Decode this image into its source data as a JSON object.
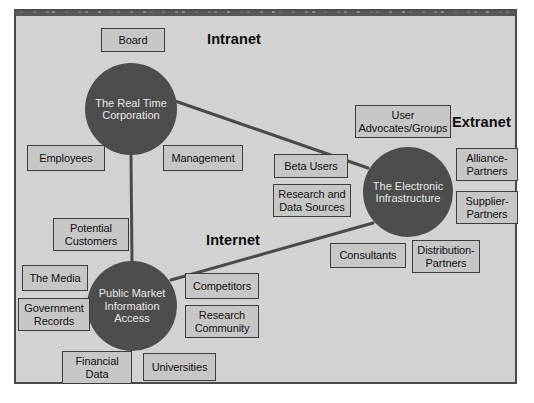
{
  "diagram": {
    "colors": {
      "page_background": "#ffffff",
      "frame_background": "#d2d2d2",
      "frame_border": "#4a4a4a",
      "box_fill": "#c6c6c6",
      "box_border": "#3d3d3d",
      "hub_fill": "#4d4d4d",
      "hub_text": "#e8e8e8",
      "edge_color": "#4a4a4a",
      "label_text": "#0d0d0d"
    },
    "zone_labels": [
      {
        "id": "intranet",
        "text": "Intranet",
        "x": 207,
        "y": 31
      },
      {
        "id": "extranet",
        "text": "Extranet",
        "x": 452,
        "y": 114
      },
      {
        "id": "internet",
        "text": "Internet",
        "x": 206,
        "y": 232
      }
    ],
    "hubs": [
      {
        "id": "real-time-corporation",
        "text": "The Real Time Corporation",
        "cx": 131,
        "cy": 109,
        "r": 46
      },
      {
        "id": "electronic-infrastructure",
        "text": "The Electronic Infrastructure",
        "cx": 408,
        "cy": 192,
        "r": 45
      },
      {
        "id": "public-market-information-access",
        "text": "Public Market Information Access",
        "cx": 132,
        "cy": 306,
        "r": 45
      }
    ],
    "boxes": [
      {
        "id": "board",
        "text": "Board",
        "x": 101,
        "y": 28,
        "w": 64,
        "h": 24
      },
      {
        "id": "employees",
        "text": "Employees",
        "x": 27,
        "y": 145,
        "w": 78,
        "h": 26
      },
      {
        "id": "management",
        "text": "Management",
        "x": 163,
        "y": 145,
        "w": 80,
        "h": 26
      },
      {
        "id": "user-advocates-groups",
        "text": "User Advocates/Groups",
        "x": 355,
        "y": 105,
        "w": 96,
        "h": 33
      },
      {
        "id": "beta-users",
        "text": "Beta Users",
        "x": 274,
        "y": 154,
        "w": 74,
        "h": 24
      },
      {
        "id": "research-and-data-sources",
        "text": "Research and Data Sources",
        "x": 273,
        "y": 184,
        "w": 78,
        "h": 33
      },
      {
        "id": "alliance-partners",
        "text": "Alliance- Partners",
        "x": 456,
        "y": 148,
        "w": 62,
        "h": 33
      },
      {
        "id": "supplier-partners",
        "text": "Supplier- Partners",
        "x": 456,
        "y": 191,
        "w": 62,
        "h": 33
      },
      {
        "id": "consultants",
        "text": "Consultants",
        "x": 330,
        "y": 243,
        "w": 76,
        "h": 25
      },
      {
        "id": "distribution-partners",
        "text": "Distribution- Partners",
        "x": 412,
        "y": 240,
        "w": 68,
        "h": 33
      },
      {
        "id": "potential-customers",
        "text": "Potential Customers",
        "x": 53,
        "y": 218,
        "w": 76,
        "h": 33
      },
      {
        "id": "the-media",
        "text": "The Media",
        "x": 22,
        "y": 265,
        "w": 66,
        "h": 26
      },
      {
        "id": "government-records",
        "text": "Government Records",
        "x": 18,
        "y": 298,
        "w": 72,
        "h": 33
      },
      {
        "id": "competitors",
        "text": "Competitors",
        "x": 185,
        "y": 273,
        "w": 74,
        "h": 26
      },
      {
        "id": "research-community",
        "text": "Research Community",
        "x": 185,
        "y": 305,
        "w": 74,
        "h": 33
      },
      {
        "id": "financial-data",
        "text": "Financial Data",
        "x": 62,
        "y": 351,
        "w": 70,
        "h": 33
      },
      {
        "id": "universities",
        "text": "Universities",
        "x": 143,
        "y": 353,
        "w": 73,
        "h": 28
      }
    ],
    "edges": [
      {
        "id": "edge-corp-to-infrastructure",
        "from": "real-time-corporation",
        "to": "electronic-infrastructure",
        "x1": 175,
        "y1": 101,
        "x2": 368,
        "y2": 168
      },
      {
        "id": "edge-corp-to-public-market",
        "from": "real-time-corporation",
        "to": "public-market-information-access",
        "x1": 131,
        "y1": 155,
        "x2": 132,
        "y2": 262
      },
      {
        "id": "edge-public-market-to-infrastructure",
        "from": "public-market-information-access",
        "to": "electronic-infrastructure",
        "x1": 171,
        "y1": 280,
        "x2": 373,
        "y2": 223
      }
    ]
  }
}
